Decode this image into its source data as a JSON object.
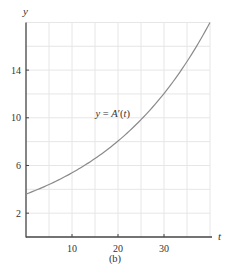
{
  "chart_data": {
    "type": "line",
    "title": "",
    "caption": "(b)",
    "xlabel": "t",
    "ylabel": "y",
    "xlim": [
      0,
      40
    ],
    "ylim": [
      0,
      18
    ],
    "xticks": [
      10,
      20,
      30
    ],
    "yticks": [
      2,
      6,
      10,
      14
    ],
    "grid": true,
    "grid_x_step": 5,
    "grid_y_step": 2,
    "series": [
      {
        "name": "y = A′(t)",
        "x": [
          0,
          5,
          10,
          15,
          20,
          25,
          30,
          35,
          40
        ],
        "values": [
          3.6,
          4.4,
          5.4,
          6.6,
          8.0,
          9.8,
          12.0,
          14.7,
          18.0
        ]
      }
    ],
    "annotations": [
      {
        "text": "y = A′(t)",
        "x": 19,
        "y": 10.4
      }
    ],
    "colors": {
      "curve": "#8a8a8a",
      "axis": "#444444",
      "grid": "#e6e6e6"
    }
  }
}
